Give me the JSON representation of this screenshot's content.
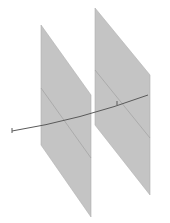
{
  "diagram": {
    "colors": {
      "plane_fill": "#c4c4c4",
      "plane_edge": "#b0b0b0",
      "plane_inner_line": "#9a9a9a",
      "line": "#5a5a5a",
      "background": "#ffffff"
    },
    "planes": [
      {
        "name": "left-plane",
        "points": "41,25 91,95 91,217 41,145",
        "diagonal": "41,88 91,158",
        "horizontal": "41,126 91,112"
      },
      {
        "name": "right-plane",
        "points": "95,8 150,75 150,195 95,125",
        "diagonal": "95,70 150,138",
        "horizontal": "95,112 150,96"
      }
    ],
    "line": {
      "path": "M12,131 Q80,120 148,95",
      "start_label": "1",
      "mid_label": "l"
    }
  }
}
